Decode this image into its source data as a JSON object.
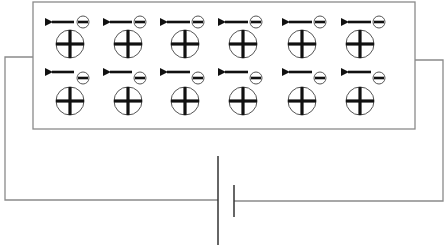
{
  "diagram": {
    "colors": {
      "wire": "#8a8a8a",
      "box": "#8a8a8a",
      "particle_outline": "#555555",
      "particle_fill": "#111111",
      "background": "#ffffff"
    },
    "conductor_box": {
      "x": 33,
      "y": 2,
      "width": 382,
      "height": 127
    },
    "rows": [
      {
        "arrow_y": 22,
        "minus_y": 22,
        "plus_y": 44
      },
      {
        "arrow_y": 72,
        "minus_y": 78,
        "plus_y": 101
      }
    ],
    "columns": [
      {
        "plus_x": 70,
        "minus_x": 83,
        "arrow_x1": 74,
        "arrow_x2": 45
      },
      {
        "plus_x": 128,
        "minus_x": 140,
        "arrow_x1": 132,
        "arrow_x2": 103
      },
      {
        "plus_x": 185,
        "minus_x": 198,
        "arrow_x1": 190,
        "arrow_x2": 160
      },
      {
        "plus_x": 243,
        "minus_x": 256,
        "arrow_x1": 248,
        "arrow_x2": 218
      },
      {
        "plus_x": 302,
        "minus_x": 320,
        "arrow_x1": 312,
        "arrow_x2": 282
      },
      {
        "plus_x": 360,
        "minus_x": 379,
        "arrow_x1": 371,
        "arrow_x2": 341
      }
    ],
    "particles": {
      "positive_ion": {
        "symbol": "+",
        "radius": 14,
        "label": "positive ion"
      },
      "electron": {
        "symbol": "−",
        "radius": 6,
        "label": "electron"
      },
      "drift_arrow": {
        "direction": "left",
        "label": "electron drift direction"
      }
    },
    "circuit": {
      "left_wire_x": 5,
      "right_wire_x": 443,
      "left_join_y": 57,
      "right_join_y": 60,
      "bottom_wire_y": 200,
      "battery": {
        "long_plate": {
          "x": 218,
          "y1": 156,
          "y2": 245,
          "label": "positive terminal"
        },
        "short_plate": {
          "x": 234,
          "y1": 185,
          "y2": 217,
          "label": "negative terminal"
        }
      }
    }
  }
}
